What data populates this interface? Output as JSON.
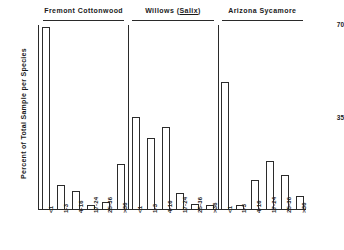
{
  "chart_data": {
    "type": "bar",
    "title": "",
    "xlabel": "",
    "ylabel": "Percent of Total Sample per Species",
    "ylim": [
      0,
      70
    ],
    "yticks": [
      0,
      35,
      70
    ],
    "ytick_labels": [
      "",
      "35",
      "70"
    ],
    "grid": false,
    "legend": "none",
    "categories": [
      "<1",
      "1-3",
      "4-16",
      "17-24",
      "25-36",
      ">36"
    ],
    "groups": [
      {
        "name": "Fremont Cottonwood",
        "name_plain": "Fremont Cottonwood",
        "italic_part": "",
        "values": [
          69,
          9,
          7,
          1.5,
          2.5,
          17
        ]
      },
      {
        "name": "Willows (Salix)",
        "name_plain": "Willows (",
        "italic_part": "Salix",
        "name_suffix": ")",
        "values": [
          35,
          27,
          31,
          6,
          2,
          1.5
        ]
      },
      {
        "name": "Arizona Sycamore",
        "name_plain": "Arizona Sycamore",
        "italic_part": "",
        "values": [
          48,
          1.5,
          11,
          18,
          13,
          5
        ]
      }
    ],
    "series": [
      {
        "name": "Fremont Cottonwood",
        "values": [
          69,
          9,
          7,
          1.5,
          2.5,
          17
        ]
      },
      {
        "name": "Willows (Salix)",
        "values": [
          35,
          27,
          31,
          6,
          2,
          1.5
        ]
      },
      {
        "name": "Arizona Sycamore",
        "values": [
          48,
          1.5,
          11,
          18,
          13,
          5
        ]
      }
    ],
    "colors": {
      "bar_fill": "#ffffff",
      "bar_stroke": "#2b2b2b",
      "axis": "#2a2a2a",
      "text": "#1a1a1a",
      "background": "#ffffff"
    }
  },
  "axis": {
    "y_label": "Percent of Total Sample per Species",
    "y_top_tick": "70",
    "y_mid_tick": "35"
  }
}
